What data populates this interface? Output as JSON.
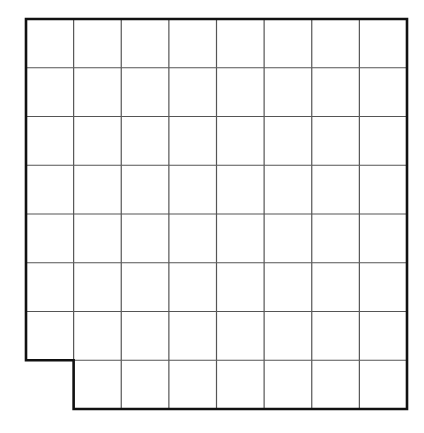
{
  "diagram": {
    "title": "8x8 grid with bottom-left square removed",
    "rows": 8,
    "cols": 8,
    "removed_cells": [
      {
        "row": 7,
        "col": 0
      }
    ],
    "cell_count": 63,
    "origin": {
      "x": 26,
      "y": 19
    },
    "size": {
      "width": 381,
      "height": 390
    },
    "colors": {
      "background": "#ffffff",
      "grid_line": "#555555",
      "border": "#111111"
    },
    "stroke": {
      "grid": 1.2,
      "border": 2.6
    }
  }
}
